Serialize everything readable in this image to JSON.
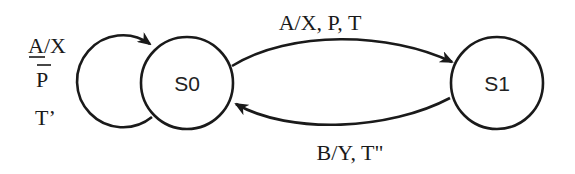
{
  "diagram": {
    "type": "state-machine",
    "states": [
      {
        "id": "S0",
        "label": "S0"
      },
      {
        "id": "S1",
        "label": "S1"
      }
    ],
    "transitions": [
      {
        "from": "S0",
        "to": "S0",
        "label_lines": [
          "A/X",
          "P",
          "T’"
        ],
        "label_line1": "A/X",
        "label_line2": "P",
        "label_line3": "T’",
        "notes": "A underlined, P overlined"
      },
      {
        "from": "S0",
        "to": "S1",
        "label": "A/X, P, T"
      },
      {
        "from": "S1",
        "to": "S0",
        "label": "B/Y, T\""
      }
    ],
    "colors": {
      "stroke": "#1a1a1a",
      "background": "#ffffff"
    }
  }
}
